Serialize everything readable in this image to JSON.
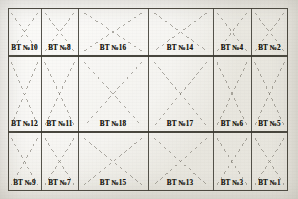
{
  "document": {
    "kind": "engineering-grid-plan",
    "title": "BT Grid Plan",
    "label_prefix": "ВТ №",
    "background_color": "#f2f1ed",
    "line_color": "#3a382f",
    "dash_color": "#7d7a70",
    "text_color": "#16150f"
  },
  "grid": {
    "columns": 6,
    "rows": 3,
    "x_positions": [
      0,
      33,
      70,
      140,
      205,
      243,
      280
    ],
    "y_positions": [
      0,
      48,
      124,
      183
    ],
    "column_widths": [
      33,
      37,
      70,
      65,
      38,
      37
    ],
    "row_heights": [
      48,
      76,
      59
    ]
  },
  "cells": [
    {
      "row": 0,
      "col": 0,
      "label": "ВТ №10",
      "pattern": "x-cross",
      "label_cx": 16.5,
      "label_cy": 40
    },
    {
      "row": 0,
      "col": 1,
      "label": "ВТ №8",
      "pattern": "x-cross",
      "label_cx": 51.5,
      "label_cy": 40
    },
    {
      "row": 0,
      "col": 2,
      "label": "ВТ №16",
      "pattern": "x-cross",
      "label_cx": 105,
      "label_cy": 40
    },
    {
      "row": 0,
      "col": 3,
      "label": "ВТ №14",
      "pattern": "x-cross",
      "label_cx": 172,
      "label_cy": 40
    },
    {
      "row": 0,
      "col": 4,
      "label": "ВТ №4",
      "pattern": "x-cross",
      "label_cx": 224,
      "label_cy": 40
    },
    {
      "row": 0,
      "col": 5,
      "label": "ВТ №2",
      "pattern": "x-cross",
      "label_cx": 261.5,
      "label_cy": 40
    },
    {
      "row": 1,
      "col": 0,
      "label": "ВТ №12",
      "pattern": "x-cross",
      "label_cx": 16.5,
      "label_cy": 116
    },
    {
      "row": 1,
      "col": 1,
      "label": "ВТ №11",
      "pattern": "x-cross",
      "label_cx": 51.5,
      "label_cy": 116
    },
    {
      "row": 1,
      "col": 2,
      "label": "ВТ №18",
      "pattern": "x-cross",
      "label_cx": 105,
      "label_cy": 116
    },
    {
      "row": 1,
      "col": 3,
      "label": "ВТ №17",
      "pattern": "x-cross",
      "label_cx": 172,
      "label_cy": 116
    },
    {
      "row": 1,
      "col": 4,
      "label": "ВТ №6",
      "pattern": "x-cross",
      "label_cx": 224,
      "label_cy": 116
    },
    {
      "row": 1,
      "col": 5,
      "label": "ВТ №5",
      "pattern": "x-cross",
      "label_cx": 261.5,
      "label_cy": 116
    },
    {
      "row": 2,
      "col": 0,
      "label": "ВТ №9",
      "pattern": "x-cross",
      "label_cx": 16.5,
      "label_cy": 175
    },
    {
      "row": 2,
      "col": 1,
      "label": "ВТ №7",
      "pattern": "x-cross",
      "label_cx": 51.5,
      "label_cy": 175
    },
    {
      "row": 2,
      "col": 2,
      "label": "ВТ №15",
      "pattern": "x-cross",
      "label_cx": 105,
      "label_cy": 175
    },
    {
      "row": 2,
      "col": 3,
      "label": "ВТ №13",
      "pattern": "x-cross",
      "label_cx": 172,
      "label_cy": 175
    },
    {
      "row": 2,
      "col": 4,
      "label": "ВТ №3",
      "pattern": "x-cross",
      "label_cx": 224,
      "label_cy": 175
    },
    {
      "row": 2,
      "col": 5,
      "label": "ВТ №1",
      "pattern": "x-cross",
      "label_cx": 261.5,
      "label_cy": 175
    }
  ]
}
